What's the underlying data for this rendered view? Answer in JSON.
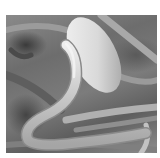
{
  "image": {
    "description": "Grayscale scanning electron micrograph of a nematode worm next to an oval egg on a fibrous substrate",
    "subjects": [
      "nematode-worm",
      "egg",
      "substrate"
    ],
    "colors": {
      "background": "#ffffff",
      "substrate_dark": "#3a3a3a",
      "substrate_mid": "#7a7a7a",
      "egg_highlight": "#f2f2f2",
      "worm_highlight": "#e6e6e6"
    }
  }
}
